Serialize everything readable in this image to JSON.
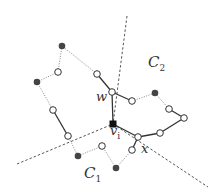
{
  "diagram": {
    "labels": {
      "c1": {
        "main": "C",
        "sub": "1"
      },
      "c2": {
        "main": "C",
        "sub": "2"
      },
      "w": {
        "main": "w"
      },
      "vi": {
        "main": "v",
        "sub": "i"
      },
      "x": {
        "main": "x"
      }
    },
    "nodes": [
      {
        "id": "a",
        "x": 62,
        "y": 46,
        "type": "filled"
      },
      {
        "id": "b",
        "x": 58,
        "y": 72,
        "type": "open"
      },
      {
        "id": "c",
        "x": 37,
        "y": 82,
        "type": "filled"
      },
      {
        "id": "d",
        "x": 53,
        "y": 110,
        "type": "open"
      },
      {
        "id": "e",
        "x": 68,
        "y": 136,
        "type": "open"
      },
      {
        "id": "f",
        "x": 78,
        "y": 156,
        "type": "filled"
      },
      {
        "id": "g",
        "x": 102,
        "y": 146,
        "type": "open"
      },
      {
        "id": "h",
        "x": 116,
        "y": 168,
        "type": "filled"
      },
      {
        "id": "i",
        "x": 132,
        "y": 150,
        "type": "open"
      },
      {
        "id": "x",
        "x": 138,
        "y": 137,
        "type": "open"
      },
      {
        "id": "vi",
        "x": 113,
        "y": 124,
        "type": "square"
      },
      {
        "id": "w",
        "x": 112,
        "y": 92,
        "type": "open"
      },
      {
        "id": "k",
        "x": 97,
        "y": 74,
        "type": "open"
      },
      {
        "id": "l",
        "x": 132,
        "y": 101,
        "type": "open"
      },
      {
        "id": "m",
        "x": 155,
        "y": 93,
        "type": "filled"
      },
      {
        "id": "n",
        "x": 169,
        "y": 109,
        "type": "open"
      },
      {
        "id": "o",
        "x": 184,
        "y": 118,
        "type": "open"
      },
      {
        "id": "p",
        "x": 160,
        "y": 133,
        "type": "open"
      }
    ],
    "edges": [
      {
        "from": "a",
        "to": "b",
        "style": "dotted"
      },
      {
        "from": "b",
        "to": "c",
        "style": "dotted"
      },
      {
        "from": "c",
        "to": "d",
        "style": "dotted"
      },
      {
        "from": "d",
        "to": "e",
        "style": "solid"
      },
      {
        "from": "e",
        "to": "f",
        "style": "dotted"
      },
      {
        "from": "f",
        "to": "g",
        "style": "dotted"
      },
      {
        "from": "g",
        "to": "h",
        "style": "dotted"
      },
      {
        "from": "h",
        "to": "i",
        "style": "dotted"
      },
      {
        "from": "i",
        "to": "x",
        "style": "solid"
      },
      {
        "from": "x",
        "to": "vi",
        "style": "solid"
      },
      {
        "from": "vi",
        "to": "w",
        "style": "solid"
      },
      {
        "from": "w",
        "to": "k",
        "style": "solid"
      },
      {
        "from": "k",
        "to": "a",
        "style": "dotted"
      },
      {
        "from": "w",
        "to": "l",
        "style": "solid"
      },
      {
        "from": "l",
        "to": "m",
        "style": "dotted"
      },
      {
        "from": "m",
        "to": "n",
        "style": "dotted"
      },
      {
        "from": "n",
        "to": "o",
        "style": "solid"
      },
      {
        "from": "o",
        "to": "p",
        "style": "solid"
      },
      {
        "from": "p",
        "to": "x",
        "style": "solid"
      }
    ],
    "dashed_lines": [
      {
        "x1": 127,
        "y1": 16,
        "x2": 113,
        "y2": 124
      },
      {
        "x1": 17,
        "y1": 164,
        "x2": 113,
        "y2": 124
      },
      {
        "x1": 113,
        "y1": 124,
        "x2": 208,
        "y2": 187
      }
    ]
  }
}
